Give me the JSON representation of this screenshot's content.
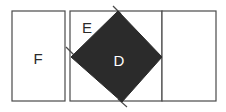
{
  "figure": {
    "background_color": "#ffffff",
    "outline_color": "#4a4a4a",
    "fill_light": "#ffffff",
    "fill_dark": "#2b2b2b",
    "label_dark_color": "#2b2b2b",
    "label_light_color": "#ffffff",
    "width": 226,
    "height": 112,
    "shapes": [
      {
        "id": "rect-f",
        "kind": "rectangle",
        "label": "F",
        "label_x": 38,
        "label_y": 57,
        "x": 12,
        "y": 11,
        "w": 53,
        "h": 90,
        "fill": "#ffffff"
      },
      {
        "id": "square-e",
        "kind": "square",
        "label": "E",
        "label_x": 87,
        "label_y": 26,
        "x": 70,
        "y": 11,
        "w": 92,
        "h": 90,
        "fill": "#ffffff"
      },
      {
        "id": "diamond-d",
        "kind": "rotated-square",
        "label": "D",
        "label_x": 119,
        "label_y": 59,
        "points": "118,11 162,57 122,102 71,57",
        "fill": "#2b2b2b"
      },
      {
        "id": "rect-right",
        "kind": "rectangle",
        "label": "",
        "label_x": 189,
        "label_y": 57,
        "x": 162,
        "y": 11,
        "w": 54,
        "h": 90,
        "fill": "#ffffff"
      }
    ],
    "spurs": [
      {
        "id": "spur-top",
        "d": "M 113,6 L 121,14"
      },
      {
        "id": "spur-bottom",
        "d": "M 118,99 L 127,107"
      },
      {
        "id": "spur-left",
        "d": "M 66,47 L 74,55"
      }
    ]
  }
}
